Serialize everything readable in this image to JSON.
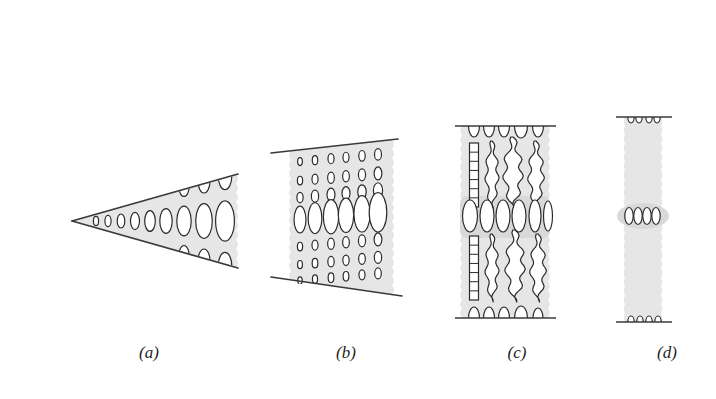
{
  "figure": {
    "background_color": "#ffffff",
    "outline_color": "#3a3a3a",
    "fill_color": "#e6e6e6",
    "fill_color_dark": "#d9d9d9",
    "ellipse_stroke_color": "#2b2b2b",
    "ellipse_fill_color": "#ffffff",
    "caption_color": "#231f20",
    "width": 716,
    "height": 399
  },
  "panels": [
    {
      "id": "a",
      "caption": "(a)",
      "caption_x": 149,
      "caption_y": 358,
      "shape": "wedge",
      "description": "Narrow triangular wedge opening to the right with rows of ellipses that grow in size toward the wide end",
      "apex": {
        "x": 72,
        "y": 221
      },
      "right_edge_x": 236,
      "top_right_y": 174,
      "bottom_right_y": 268,
      "rows": [
        {
          "name": "center-row",
          "clipped": false,
          "ellipses": [
            {
              "cx": 96,
              "cy": 221,
              "rx": 2.6,
              "ry": 4.6
            },
            {
              "cx": 108,
              "cy": 221,
              "rx": 3.1,
              "ry": 5.6
            },
            {
              "cx": 121,
              "cy": 221,
              "rx": 3.8,
              "ry": 7.0
            },
            {
              "cx": 135,
              "cy": 221,
              "rx": 4.5,
              "ry": 8.6
            },
            {
              "cx": 150,
              "cy": 221,
              "rx": 5.3,
              "ry": 10.4
            },
            {
              "cx": 166,
              "cy": 221,
              "rx": 6.2,
              "ry": 12.4
            },
            {
              "cx": 184,
              "cy": 221,
              "rx": 7.2,
              "ry": 14.8
            },
            {
              "cx": 204,
              "cy": 221,
              "rx": 8.3,
              "ry": 17.4
            },
            {
              "cx": 225,
              "cy": 221,
              "rx": 9.4,
              "ry": 20.2
            }
          ]
        },
        {
          "name": "upper-row",
          "clipped": true,
          "ellipses": [
            {
              "cx": 184,
              "cy": 186,
              "rx": 5.2,
              "ry": 10.5
            },
            {
              "cx": 204,
              "cy": 181,
              "rx": 6.0,
              "ry": 12.0
            },
            {
              "cx": 225,
              "cy": 176,
              "rx": 6.8,
              "ry": 13.6
            }
          ]
        },
        {
          "name": "lower-row",
          "clipped": true,
          "ellipses": [
            {
              "cx": 184,
              "cy": 256,
              "rx": 5.2,
              "ry": 10.5
            },
            {
              "cx": 204,
              "cy": 261,
              "rx": 6.0,
              "ry": 12.0
            },
            {
              "cx": 225,
              "cy": 266,
              "rx": 6.8,
              "ry": 13.6
            }
          ]
        }
      ]
    },
    {
      "id": "b",
      "caption": "(b)",
      "caption_x": 346,
      "caption_y": 358,
      "shape": "trapezoid",
      "description": "Trapezoidal band bounded by two diverging straight lines, filled with a 6-column grid of ellipses; middle row is much larger",
      "top_line": {
        "x1": 271,
        "y1": 153,
        "x2": 398,
        "y2": 139
      },
      "bottom_line": {
        "x1": 271,
        "y1": 277,
        "x2": 402,
        "y2": 296
      },
      "body_left_x": 291,
      "body_right_x": 392,
      "columns_x": [
        300,
        315,
        331,
        346,
        362,
        378
      ],
      "row_ys": [
        158,
        177,
        194,
        216,
        243,
        261,
        277
      ],
      "row_scale": [
        0.72,
        0.8,
        0.95,
        2.45,
        0.8,
        0.75,
        0.68
      ],
      "column_scale": [
        0.78,
        0.9,
        1.0,
        1.0,
        1.06,
        1.15
      ],
      "base_rx": 4.2,
      "base_ry": 7.0
    },
    {
      "id": "c",
      "caption": "(c)",
      "caption_x": 517,
      "caption_y": 358,
      "shape": "column-crenulated",
      "description": "Vertical rectangular column capped by horizontal lines; upper and lower zones contain tall crinkly/wavy vertical lobes, central band holds a row of plain upright ellipses",
      "left_x": 462,
      "right_x": 548,
      "top_line": {
        "x1": 455,
        "y1": 126,
        "x2": 556,
        "y2": 126
      },
      "bottom_line": {
        "x1": 455,
        "y1": 318,
        "x2": 556,
        "y2": 318
      },
      "top_clipped_ellipses": [
        {
          "cx": 474,
          "cy": 126,
          "rx": 5.5,
          "ry": 11
        },
        {
          "cx": 489,
          "cy": 126,
          "rx": 5.5,
          "ry": 11
        },
        {
          "cx": 504,
          "cy": 126,
          "rx": 5.5,
          "ry": 11
        },
        {
          "cx": 521,
          "cy": 126,
          "rx": 6.5,
          "ry": 12
        },
        {
          "cx": 538,
          "cy": 126,
          "rx": 5.5,
          "ry": 11
        }
      ],
      "bottom_clipped_ellipses": [
        {
          "cx": 474,
          "cy": 318,
          "rx": 5.5,
          "ry": 11
        },
        {
          "cx": 489,
          "cy": 318,
          "rx": 5.5,
          "ry": 11
        },
        {
          "cx": 504,
          "cy": 318,
          "rx": 5.5,
          "ry": 11
        },
        {
          "cx": 521,
          "cy": 318,
          "rx": 6.5,
          "ry": 12
        },
        {
          "cx": 538,
          "cy": 318,
          "rx": 5.0,
          "ry": 10
        }
      ],
      "upper_lobes": [
        {
          "cx": 474,
          "cy": 175,
          "rx": 4.5,
          "ry": 32,
          "style": "box"
        },
        {
          "cx": 492,
          "cy": 175,
          "rx": 5.5,
          "ry": 34,
          "style": "wavy"
        },
        {
          "cx": 513,
          "cy": 173,
          "rx": 8.0,
          "ry": 36,
          "style": "wavy"
        },
        {
          "cx": 536,
          "cy": 175,
          "rx": 6.5,
          "ry": 34,
          "style": "wavy"
        }
      ],
      "middle_ellipses": [
        {
          "cx": 470,
          "cy": 216,
          "rx": 7.5,
          "ry": 16
        },
        {
          "cx": 487,
          "cy": 216,
          "rx": 7.0,
          "ry": 16
        },
        {
          "cx": 503,
          "cy": 216,
          "rx": 7.0,
          "ry": 16
        },
        {
          "cx": 519,
          "cy": 216,
          "rx": 7.0,
          "ry": 16
        },
        {
          "cx": 535,
          "cy": 216,
          "rx": 6.0,
          "ry": 16
        },
        {
          "cx": 548,
          "cy": 216,
          "rx": 4.5,
          "ry": 15
        }
      ],
      "lower_lobes": [
        {
          "cx": 474,
          "cy": 268,
          "rx": 4.5,
          "ry": 32,
          "style": "box"
        },
        {
          "cx": 492,
          "cy": 268,
          "rx": 5.5,
          "ry": 34,
          "style": "wavy"
        },
        {
          "cx": 515,
          "cy": 266,
          "rx": 8.0,
          "ry": 36,
          "style": "wavy"
        },
        {
          "cx": 538,
          "cy": 268,
          "rx": 6.5,
          "ry": 34,
          "style": "wavy"
        }
      ]
    },
    {
      "id": "d",
      "caption": "(d)",
      "caption_x": 667,
      "caption_y": 358,
      "shape": "narrow-strip",
      "description": "Narrow vertical strip with horizontal caps top and bottom; four small ellipses at the top edge, four in a slight central bulge, four at the bottom edge",
      "left_x": 625,
      "right_x": 661,
      "top_line": {
        "x1": 616,
        "y1": 117,
        "x2": 672,
        "y2": 117
      },
      "bottom_line": {
        "x1": 616,
        "y1": 322,
        "x2": 672,
        "y2": 322
      },
      "bulge": {
        "cx": 643,
        "cy": 216,
        "rx": 26,
        "ry": 13
      },
      "top_ellipses": [
        {
          "cx": 631,
          "cy": 117,
          "rx": 3.2,
          "ry": 6
        },
        {
          "cx": 639,
          "cy": 117,
          "rx": 3.2,
          "ry": 6
        },
        {
          "cx": 649,
          "cy": 117,
          "rx": 3.2,
          "ry": 6
        },
        {
          "cx": 657,
          "cy": 117,
          "rx": 3.2,
          "ry": 6
        }
      ],
      "middle_ellipses": [
        {
          "cx": 629,
          "cy": 216,
          "rx": 4.2,
          "ry": 8.5
        },
        {
          "cx": 638,
          "cy": 216,
          "rx": 4.2,
          "ry": 8.5
        },
        {
          "cx": 647,
          "cy": 216,
          "rx": 4.2,
          "ry": 8.5
        },
        {
          "cx": 656,
          "cy": 216,
          "rx": 4.2,
          "ry": 8.5
        }
      ],
      "bottom_ellipses": [
        {
          "cx": 631,
          "cy": 322,
          "rx": 3.2,
          "ry": 6
        },
        {
          "cx": 640,
          "cy": 322,
          "rx": 3.2,
          "ry": 6
        },
        {
          "cx": 649,
          "cy": 322,
          "rx": 3.2,
          "ry": 6
        },
        {
          "cx": 658,
          "cy": 322,
          "rx": 3.2,
          "ry": 6
        }
      ]
    }
  ]
}
